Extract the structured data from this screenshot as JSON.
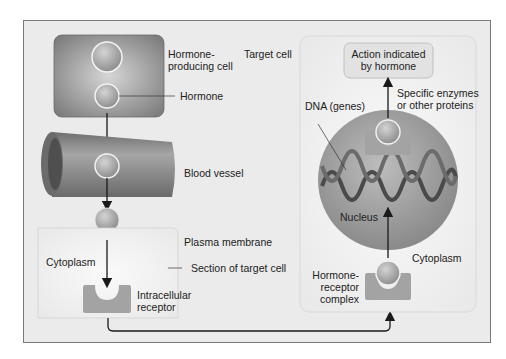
{
  "diagram": {
    "colors": {
      "background": "#ebebeb",
      "frame_border": "#7a7a7a",
      "cell_dark": "#8c8c8c",
      "vessel": "#8a8a8a",
      "hormone_sphere": "#a9a9a9",
      "receptor": "#a3a3a3",
      "nucleus": "#9e9e9e",
      "target_panel": "#f2f2f2",
      "arrow": "#1a1a1a"
    },
    "labels": {
      "hormone_producing_cell": "Hormone-\nproducing cell",
      "hormone_producing_line1": "Hormone-",
      "hormone_producing_line2": "producing cell",
      "hormone": "Hormone",
      "target_cell": "Target cell",
      "blood_vessel": "Blood vessel",
      "plasma_membrane": "Plasma membrane",
      "cytoplasm_left": "Cytoplasm",
      "section_of_target_cell": "Section of target cell",
      "intracellular_line1": "Intracellular",
      "intracellular_line2": "receptor",
      "action_line1": "Action indicated",
      "action_line2": "by hormone",
      "enzymes_line1": "Specific enzymes",
      "enzymes_line2": "or other proteins",
      "dna": "DNA (genes)",
      "nucleus": "Nucleus",
      "cytoplasm_right": "Cytoplasm",
      "complex_line1": "Hormone-",
      "complex_line2": "receptor",
      "complex_line3": "complex"
    }
  }
}
